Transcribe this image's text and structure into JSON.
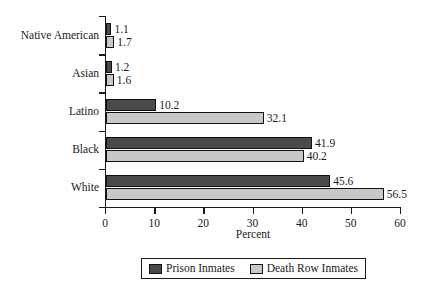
{
  "chart_data": {
    "type": "bar",
    "orientation": "horizontal",
    "title": "",
    "xlabel": "Percent",
    "ylabel": "",
    "xlim": [
      0,
      60
    ],
    "xticks": [
      0,
      10,
      20,
      30,
      40,
      50,
      60
    ],
    "xtick_labels": [
      "0",
      "10",
      "20",
      "30",
      "40",
      "50",
      "60"
    ],
    "grid": false,
    "legend_position": "bottom-center",
    "categories": [
      "Native American",
      "Asian",
      "Latino",
      "Black",
      "White"
    ],
    "series": [
      {
        "name": "Prison Inmates",
        "color": "#4a4a4a",
        "values": [
          1.1,
          1.2,
          10.2,
          41.9,
          45.6
        ],
        "value_labels": [
          "1.1",
          "1.2",
          "10.2",
          "41.9",
          "45.6"
        ]
      },
      {
        "name": "Death Row Inmates",
        "color": "#c8c8c8",
        "values": [
          1.7,
          1.6,
          32.1,
          40.2,
          56.5
        ],
        "value_labels": [
          "1.7",
          "1.6",
          "32.1",
          "40.2",
          "56.5"
        ]
      }
    ]
  },
  "axis": {
    "x_title": "Percent"
  },
  "legend": {
    "entries": [
      {
        "label": "Prison Inmates",
        "swatch": "#4a4a4a"
      },
      {
        "label": "Death Row Inmates",
        "swatch": "#c8c8c8"
      }
    ]
  },
  "colors": {
    "prison_inmates": "#4a4a4a",
    "death_row_inmates": "#c8c8c8",
    "axis": "#1a1a1a",
    "background": "#ffffff"
  }
}
